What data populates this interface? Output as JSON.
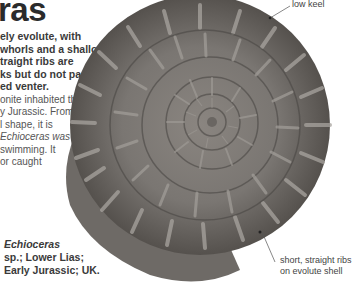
{
  "title": "ras",
  "lead_lines": [
    "ely evolute, with",
    "whorls and a shallow",
    "traight ribs are",
    "ks but do not pass",
    "ed venter."
  ],
  "body_lines": [
    "onite inhabited the",
    "y Jurassic. From",
    "l shape, it is",
    "Echioceras was",
    "swimming. It",
    "or caught"
  ],
  "caption": {
    "genus": "Echioceras",
    "line2": "sp.; Lower Lias;",
    "line3": "Early Jurassic; UK."
  },
  "annotations": {
    "keel": "low keel",
    "ribs_line1": "short, straight ribs",
    "ribs_line2": "on evolute shell"
  },
  "colors": {
    "text_dark": "#2b2b2b",
    "text_body": "#555555",
    "fossil_mid": "#7a7672",
    "fossil_dark": "#4a4744",
    "fossil_light": "#a8a49f"
  }
}
